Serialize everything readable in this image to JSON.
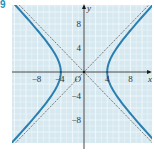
{
  "figure": {
    "label": "9"
  },
  "colors": {
    "background": "#d6e8f0",
    "grid": "#f2f8fb",
    "axis": "#1a1a1a",
    "curve": "#2a7fb0",
    "asymptote": "#555555",
    "tick_text": "#333333",
    "label_accent": "#1f8fb8"
  },
  "chart_data": {
    "type": "line",
    "title": "",
    "xlabel": "x",
    "ylabel": "y",
    "origin_label": "O",
    "xlim": [
      -11,
      11
    ],
    "ylim": [
      -11,
      11
    ],
    "grid": true,
    "grid_step": 2,
    "x_ticks": [
      -8,
      -4,
      4,
      8
    ],
    "x_tick_labels": [
      "−8",
      "−4",
      "4",
      "8"
    ],
    "y_ticks": [
      8,
      4,
      -4,
      -8
    ],
    "y_tick_labels": [
      "8",
      "4",
      "−4",
      "−8"
    ],
    "series": [
      {
        "name": "hyperbola",
        "equation": "x²/16 − y²/16 = 1",
        "style": "solid-thick",
        "vertices": [
          [
            -4,
            0
          ],
          [
            4,
            0
          ]
        ]
      },
      {
        "name": "asymptote y = x",
        "equation": "y = x",
        "style": "dashed-thin"
      },
      {
        "name": "asymptote y = −x",
        "equation": "y = −x",
        "style": "dashed-thin"
      }
    ]
  }
}
